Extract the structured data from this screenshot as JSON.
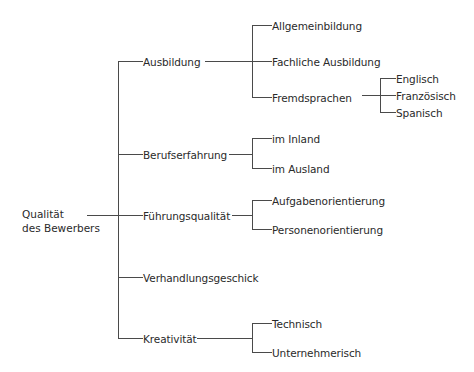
{
  "diagram": {
    "type": "tree",
    "line_color": "#4a4a4a",
    "root": {
      "line1": "Qualität",
      "line2": "des Bewerbers"
    },
    "branches": [
      {
        "label": "Ausbildung",
        "children": [
          {
            "label": "Allgemeinbildung"
          },
          {
            "label": "Fachliche Ausbildung"
          },
          {
            "label": "Fremdsprachen",
            "children": [
              {
                "label": "Englisch"
              },
              {
                "label": "Französisch"
              },
              {
                "label": "Spanisch"
              }
            ]
          }
        ]
      },
      {
        "label": "Berufserfahrung",
        "children": [
          {
            "label": "im Inland"
          },
          {
            "label": "im Ausland"
          }
        ]
      },
      {
        "label": "Führungsqualität",
        "children": [
          {
            "label": "Aufgabenorientierung"
          },
          {
            "label": "Personenorientierung"
          }
        ]
      },
      {
        "label": "Verhandlungsgeschick"
      },
      {
        "label": "Kreativität",
        "children": [
          {
            "label": "Technisch"
          },
          {
            "label": "Unternehmerisch"
          }
        ]
      }
    ]
  }
}
